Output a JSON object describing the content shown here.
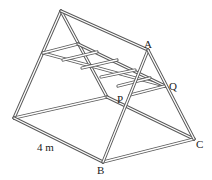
{
  "figure": {
    "labels": {
      "A": "A",
      "B": "B",
      "C": "C",
      "P": "P",
      "Q": "Q",
      "length": "4 m"
    },
    "colors": {
      "tube_outline": "#555555",
      "tube_fill": "#ffffff",
      "text": "#222222"
    }
  }
}
